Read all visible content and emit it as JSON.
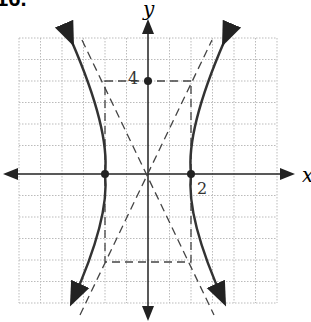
{
  "problem_number": "16.",
  "axes": {
    "x_label": "x",
    "y_label": "y"
  },
  "labels": {
    "y_tick": "4",
    "x_tick": "2"
  },
  "graph": {
    "type": "hyperbola",
    "orientation": "horizontal transverse axis",
    "center": [
      0,
      0
    ],
    "vertices": [
      [
        -2,
        0
      ],
      [
        2,
        0
      ]
    ],
    "co_vertex_marked": [
      0,
      4
    ],
    "asymptotes": [
      "y = 2x",
      "y = -2x"
    ],
    "guide_rectangle": {
      "x": [
        -2,
        2
      ],
      "y": [
        -4,
        4
      ]
    }
  },
  "colors": {
    "curve": "#333333",
    "grid": "#bbbbbb",
    "axis": "#222222"
  }
}
